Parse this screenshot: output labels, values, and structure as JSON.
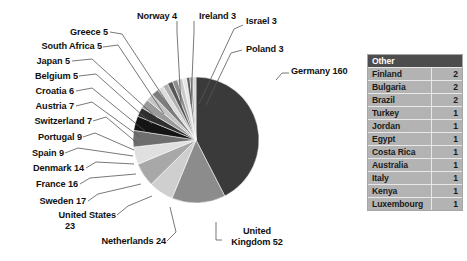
{
  "chart_data": {
    "type": "pie",
    "title": "",
    "xlabel": "",
    "ylabel": "",
    "legend_position": "right",
    "grid": false,
    "categories": [
      "Germany",
      "United Kingdom",
      "Netherlands",
      "United States",
      "Sweden",
      "France",
      "Denmark",
      "Spain",
      "Portugal",
      "Switzerland",
      "Austria",
      "Croatia",
      "Belgium",
      "Japan",
      "South Africa",
      "Greece",
      "Norway",
      "Ireland",
      "Israel",
      "Poland"
    ],
    "values": [
      160,
      52,
      24,
      23,
      17,
      16,
      14,
      9,
      9,
      7,
      7,
      6,
      5,
      5,
      5,
      5,
      4,
      3,
      3,
      3
    ],
    "colors": [
      "#3a3a3a",
      "#8c8c8c",
      "#cfcfcf",
      "#a8a8a8",
      "#e0e0e0",
      "#6e6e6e",
      "#141414",
      "#2f2f2f",
      "#9a9a9a",
      "#c4c4c4",
      "#7d7d7d",
      "#dcdcdc",
      "#b0b0b0",
      "#565656",
      "#8f8f8f",
      "#c9c9c9",
      "#e6e6e6",
      "#5a5a5a",
      "#9e9e9e",
      "#d4d4d4"
    ],
    "slices": [
      {
        "label": "Germany",
        "value": 160,
        "label_text": "Germany 160"
      },
      {
        "label": "United Kingdom",
        "value": 52,
        "label_text": "United Kingdom 52"
      },
      {
        "label": "Netherlands",
        "value": 24,
        "label_text": "Netherlands 24"
      },
      {
        "label": "United States",
        "value": 23,
        "label_text": "United States 23"
      },
      {
        "label": "Sweden",
        "value": 17,
        "label_text": "Sweden 17"
      },
      {
        "label": "France",
        "value": 16,
        "label_text": "France 16"
      },
      {
        "label": "Denmark",
        "value": 14,
        "label_text": "Denmark 14"
      },
      {
        "label": "Spain",
        "value": 9,
        "label_text": "Spain 9"
      },
      {
        "label": "Portugal",
        "value": 9,
        "label_text": "Portugal 9"
      },
      {
        "label": "Switzerland",
        "value": 7,
        "label_text": "Switzerland 7"
      },
      {
        "label": "Austria",
        "value": 7,
        "label_text": "Austria 7"
      },
      {
        "label": "Croatia",
        "value": 6,
        "label_text": "Croatia 6"
      },
      {
        "label": "Belgium",
        "value": 5,
        "label_text": "Belgium 5"
      },
      {
        "label": "Japan",
        "value": 5,
        "label_text": "Japan 5"
      },
      {
        "label": "South Africa",
        "value": 5,
        "label_text": "South Africa 5"
      },
      {
        "label": "Greece",
        "value": 5,
        "label_text": "Greece 5"
      },
      {
        "label": "Norway",
        "value": 4,
        "label_text": "Norway 4"
      },
      {
        "label": "Ireland",
        "value": 3,
        "label_text": "Ireland 3"
      },
      {
        "label": "Israel",
        "value": 3,
        "label_text": "Israel 3"
      },
      {
        "label": "Poland",
        "value": 3,
        "label_text": "Poland 3"
      }
    ]
  },
  "labels": {
    "germany": "Germany 160",
    "uk_line1": "United",
    "uk_line2": "Kingdom 52",
    "netherlands": "Netherlands 24",
    "us_line1": "United States",
    "us_line2": "23",
    "sweden": "Sweden 17",
    "france": "France 16",
    "denmark": "Denmark 14",
    "spain": "Spain 9",
    "portugal": "Portugal 9",
    "switzerland": "Switzerland 7",
    "austria": "Austria 7",
    "croatia": "Croatia 6",
    "belgium": "Belgium 5",
    "japan": "Japan 5",
    "south_africa": "South Africa 5",
    "greece": "Greece 5",
    "norway": "Norway 4",
    "ireland": "Ireland 3",
    "israel": "Israel 3",
    "poland": "Poland 3"
  },
  "legend": {
    "header": "Other",
    "rows": [
      {
        "name": "Finland",
        "value": "2"
      },
      {
        "name": "Bulgaria",
        "value": "2"
      },
      {
        "name": "Brazil",
        "value": "2"
      },
      {
        "name": "Turkey",
        "value": "1"
      },
      {
        "name": "Jordan",
        "value": "1"
      },
      {
        "name": "Egypt",
        "value": "1"
      },
      {
        "name": "Costa Rica",
        "value": "1"
      },
      {
        "name": "Australia",
        "value": "1"
      },
      {
        "name": "Italy",
        "value": "1"
      },
      {
        "name": "Kenya",
        "value": "1"
      },
      {
        "name": "Luxembourg",
        "value": "1"
      }
    ]
  },
  "colors": {
    "background": "#ffffff",
    "legend_header_bg": "#4d4d4d",
    "legend_row_bg": "#b3b3b3",
    "legend_border": "#a6a6a6",
    "text": "#111111",
    "leader_line": "#555555"
  }
}
